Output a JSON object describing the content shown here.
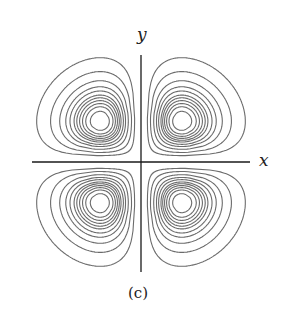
{
  "figure": {
    "caption": "(c)",
    "axes": {
      "x_label": "x",
      "y_label": "y",
      "origin_px": [
        141,
        162
      ],
      "x_axis_px": [
        32,
        250
      ],
      "y_axis_px": [
        55,
        272
      ]
    },
    "contours": {
      "function": "x*y*exp(-(x^2+y^2))",
      "levels": [
        0.02,
        0.045,
        0.07,
        0.09,
        0.105,
        0.12,
        0.13,
        0.14,
        0.15,
        0.16,
        0.172
      ],
      "scale_px": 52,
      "lobe_offset_px": 4,
      "line_color": "#6b6b6b",
      "axis_color": "#1a1a1a"
    }
  }
}
